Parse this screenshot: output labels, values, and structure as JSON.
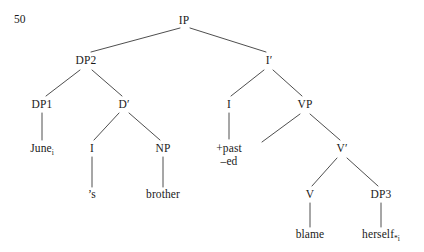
{
  "figure": {
    "example_number": "50",
    "type": "syntax-tree",
    "stroke_color": "#3a3a3a",
    "text_color": "#1a1a1a",
    "background": "#ffffff"
  },
  "nodes": {
    "ip": {
      "label": "IP",
      "x": 184,
      "y": 22
    },
    "dp2": {
      "label": "DP2",
      "x": 86,
      "y": 62
    },
    "ibar": {
      "label": "I′",
      "x": 269,
      "y": 62
    },
    "dp1": {
      "label": "DP1",
      "x": 42,
      "y": 106
    },
    "dbar": {
      "label": "D′",
      "x": 124,
      "y": 106
    },
    "i_infl": {
      "label": "I",
      "x": 229,
      "y": 106
    },
    "vp": {
      "label": "VP",
      "x": 305,
      "y": 106
    },
    "june": {
      "label": "June",
      "sub": "i",
      "x": 42,
      "y": 150
    },
    "i_poss": {
      "label": "I",
      "x": 92,
      "y": 150
    },
    "np": {
      "label": "NP",
      "x": 163,
      "y": 150
    },
    "infl_feat": {
      "label": "+past",
      "label2": "–ed",
      "x": 229,
      "y": 150
    },
    "vbar": {
      "label": "V′",
      "x": 342,
      "y": 150
    },
    "poss_s": {
      "label": "’s",
      "x": 92,
      "y": 196
    },
    "brother": {
      "label": "brother",
      "x": 163,
      "y": 196
    },
    "v": {
      "label": "V",
      "x": 310,
      "y": 196
    },
    "dp3": {
      "label": "DP3",
      "x": 381,
      "y": 196
    },
    "blame": {
      "label": "blame",
      "x": 310,
      "y": 236
    },
    "herself": {
      "label": "herself",
      "sub": "*i",
      "x": 381,
      "y": 236
    }
  },
  "edges": [
    {
      "name": "ip-to-dp2",
      "x1": 180,
      "y1": 28,
      "x2": 91,
      "y2": 52
    },
    {
      "name": "ip-to-ibar",
      "x1": 190,
      "y1": 28,
      "x2": 266,
      "y2": 52
    },
    {
      "name": "dp2-to-dp1",
      "x1": 80,
      "y1": 70,
      "x2": 46,
      "y2": 96
    },
    {
      "name": "dp2-to-dbar",
      "x1": 92,
      "y1": 70,
      "x2": 122,
      "y2": 96
    },
    {
      "name": "ibar-to-i",
      "x1": 264,
      "y1": 70,
      "x2": 231,
      "y2": 96
    },
    {
      "name": "ibar-to-vp",
      "x1": 273,
      "y1": 70,
      "x2": 302,
      "y2": 96
    },
    {
      "name": "dp1-to-june",
      "x1": 42,
      "y1": 113,
      "x2": 42,
      "y2": 140
    },
    {
      "name": "dbar-to-i-poss",
      "x1": 119,
      "y1": 113,
      "x2": 94,
      "y2": 140
    },
    {
      "name": "dbar-to-np",
      "x1": 129,
      "y1": 113,
      "x2": 160,
      "y2": 140
    },
    {
      "name": "i-to-infl-features",
      "x1": 229,
      "y1": 113,
      "x2": 229,
      "y2": 139
    },
    {
      "name": "vp-to-spec",
      "x1": 300,
      "y1": 114,
      "x2": 262,
      "y2": 142
    },
    {
      "name": "vp-to-vbar",
      "x1": 310,
      "y1": 114,
      "x2": 340,
      "y2": 140
    },
    {
      "name": "i-poss-to-s",
      "x1": 92,
      "y1": 157,
      "x2": 92,
      "y2": 187
    },
    {
      "name": "np-to-brother",
      "x1": 163,
      "y1": 157,
      "x2": 163,
      "y2": 187
    },
    {
      "name": "vbar-to-v",
      "x1": 337,
      "y1": 158,
      "x2": 312,
      "y2": 186
    },
    {
      "name": "vbar-to-dp3",
      "x1": 347,
      "y1": 158,
      "x2": 378,
      "y2": 186
    },
    {
      "name": "v-to-blame",
      "x1": 310,
      "y1": 203,
      "x2": 310,
      "y2": 227
    },
    {
      "name": "dp3-to-herself",
      "x1": 381,
      "y1": 203,
      "x2": 381,
      "y2": 227
    }
  ]
}
